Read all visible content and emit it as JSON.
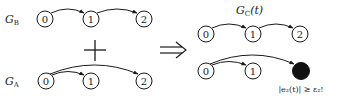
{
  "graphs": {
    "B": {
      "label": "G",
      "subscript": "B",
      "nodes": [
        "0",
        "1",
        "2"
      ],
      "edges": [
        [
          "0",
          "1"
        ],
        [
          "1",
          "2"
        ]
      ]
    },
    "A": {
      "label": "G",
      "subscript": "A",
      "nodes": [
        "0",
        "1",
        "2"
      ],
      "edges": [
        [
          "0",
          "1"
        ],
        [
          "0",
          "2"
        ]
      ]
    },
    "C": {
      "label": "G",
      "subscript": "C",
      "arg": "(t)",
      "nodes_top": [
        "0",
        "1",
        "2"
      ],
      "edges_top": [
        [
          "0",
          "1"
        ],
        [
          "1",
          "2"
        ]
      ],
      "nodes_bottom": [
        "0",
        "1",
        "2"
      ],
      "edges_bottom": [
        [
          "0",
          "1"
        ],
        [
          "0",
          "2"
        ]
      ]
    }
  },
  "operators": {
    "plus": "+",
    "implies": "⇒"
  },
  "annotation": "|e₂(t)| ≥ ε₂!",
  "colors": {
    "stroke": "#1a1a1a",
    "highlight_node": "#111111"
  }
}
